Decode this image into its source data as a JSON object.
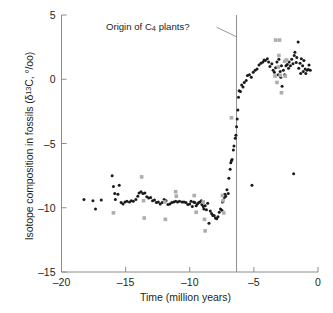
{
  "figure": {
    "annotation": {
      "prefix": "Origin of C",
      "sub": "4",
      "suffix": " plants?"
    },
    "y_axis_label": {
      "prefix": "Isotope composition in fossils (δ",
      "sup": "13",
      "suffix": "C, °/oo)"
    },
    "x_axis_label": "Time (million years)"
  },
  "chart_data": {
    "type": "scatter",
    "title": "",
    "xlabel": "Time (million years)",
    "ylabel": "Isotope composition in fossils (δ13C, °/oo)",
    "xlim": [
      -20,
      0
    ],
    "ylim": [
      -15,
      5
    ],
    "xticks": [
      -20,
      -15,
      -10,
      -5,
      0
    ],
    "xticklabels": [
      "–20",
      "–15",
      "–10",
      "–5",
      "0"
    ],
    "yticks": [
      -15,
      -10,
      -5,
      0,
      5
    ],
    "yticklabels": [
      "–15",
      "–10",
      "–5",
      "0",
      "5"
    ],
    "grid": false,
    "legend": false,
    "annotations": [
      {
        "text": "Origin of C4 plants?",
        "x": -6.35,
        "kind": "vertical-line-with-leader",
        "line_color": "#8c8c8c",
        "leader_from": [
          -7.9,
          4.05
        ],
        "leader_to": [
          -6.35,
          3.3
        ]
      }
    ],
    "series": [
      {
        "name": "black-circles",
        "marker": "circle",
        "color": "#1a1a1a",
        "size": 3.0,
        "points": [
          [
            -18.25,
            -9.35
          ],
          [
            -17.55,
            -9.45
          ],
          [
            -17.35,
            -10.1
          ],
          [
            -16.9,
            -9.4
          ],
          [
            -16.05,
            -7.5
          ],
          [
            -15.95,
            -8.35
          ],
          [
            -15.85,
            -8.9
          ],
          [
            -15.8,
            -9.35
          ],
          [
            -15.6,
            -8.95
          ],
          [
            -15.5,
            -8.25
          ],
          [
            -15.35,
            -9.6
          ],
          [
            -15.2,
            -9.7
          ],
          [
            -15.05,
            -9.55
          ],
          [
            -14.9,
            -9.5
          ],
          [
            -14.7,
            -9.55
          ],
          [
            -14.55,
            -9.45
          ],
          [
            -14.4,
            -9.5
          ],
          [
            -14.2,
            -9.35
          ],
          [
            -14.05,
            -9.1
          ],
          [
            -13.95,
            -8.85
          ],
          [
            -13.8,
            -8.75
          ],
          [
            -13.65,
            -8.9
          ],
          [
            -13.5,
            -8.85
          ],
          [
            -13.35,
            -9.15
          ],
          [
            -13.2,
            -9.25
          ],
          [
            -13.05,
            -9.2
          ],
          [
            -12.9,
            -9.45
          ],
          [
            -12.75,
            -9.4
          ],
          [
            -12.6,
            -9.6
          ],
          [
            -12.45,
            -9.55
          ],
          [
            -12.3,
            -9.7
          ],
          [
            -12.15,
            -9.6
          ],
          [
            -12.0,
            -9.35
          ],
          [
            -11.85,
            -9.45
          ],
          [
            -11.7,
            -9.75
          ],
          [
            -11.55,
            -9.7
          ],
          [
            -11.4,
            -9.6
          ],
          [
            -11.25,
            -9.55
          ],
          [
            -11.1,
            -9.5
          ],
          [
            -10.95,
            -9.55
          ],
          [
            -10.8,
            -9.5
          ],
          [
            -10.6,
            -9.55
          ],
          [
            -10.45,
            -9.55
          ],
          [
            -10.3,
            -9.6
          ],
          [
            -10.15,
            -9.75
          ],
          [
            -10.0,
            -9.7
          ],
          [
            -9.9,
            -9.5
          ],
          [
            -9.8,
            -9.9
          ],
          [
            -9.7,
            -9.55
          ],
          [
            -9.6,
            -9.6
          ],
          [
            -9.5,
            -9.85
          ],
          [
            -9.4,
            -9.7
          ],
          [
            -9.3,
            -9.6
          ],
          [
            -9.2,
            -9.55
          ],
          [
            -9.1,
            -9.45
          ],
          [
            -9.05,
            -9.75
          ],
          [
            -8.95,
            -9.9
          ],
          [
            -8.9,
            -10.1
          ],
          [
            -8.8,
            -9.85
          ],
          [
            -8.7,
            -10.15
          ],
          [
            -8.6,
            -9.65
          ],
          [
            -8.5,
            -11.2
          ],
          [
            -8.4,
            -10.25
          ],
          [
            -8.3,
            -10.45
          ],
          [
            -8.2,
            -10.6
          ],
          [
            -8.1,
            -10.6
          ],
          [
            -8.0,
            -10.8
          ],
          [
            -7.9,
            -10.85
          ],
          [
            -7.8,
            -10.7
          ],
          [
            -7.7,
            -10.35
          ],
          [
            -7.6,
            -10.1
          ],
          [
            -7.5,
            -10.2
          ],
          [
            -7.45,
            -9.55
          ],
          [
            -7.35,
            -9.0
          ],
          [
            -7.3,
            -9.2
          ],
          [
            -7.25,
            -8.95
          ],
          [
            -7.2,
            -9.1
          ],
          [
            -7.1,
            -8.6
          ],
          [
            -7.0,
            -8.9
          ],
          [
            -6.95,
            -7.7
          ],
          [
            -6.85,
            -7.0
          ],
          [
            -6.8,
            -6.5
          ],
          [
            -6.75,
            -6.35
          ],
          [
            -6.7,
            -6.25
          ],
          [
            -6.6,
            -5.5
          ],
          [
            -6.55,
            -5.2
          ],
          [
            -6.45,
            -4.6
          ],
          [
            -6.4,
            -4.35
          ],
          [
            -6.35,
            -3.7
          ],
          [
            -6.3,
            -3.1
          ],
          [
            -6.25,
            -2.4
          ],
          [
            -6.2,
            -1.4
          ],
          [
            -6.15,
            -0.9
          ],
          [
            -6.05,
            -0.95
          ],
          [
            -5.95,
            -0.45
          ],
          [
            -5.85,
            -0.6
          ],
          [
            -5.75,
            -0.25
          ],
          [
            -5.6,
            -0.1
          ],
          [
            -5.5,
            0.3
          ],
          [
            -5.35,
            0.35
          ],
          [
            -5.2,
            0.15
          ],
          [
            -5.05,
            0.55
          ],
          [
            -4.9,
            0.7
          ],
          [
            -4.75,
            0.8
          ],
          [
            -4.6,
            1.1
          ],
          [
            -4.45,
            1.25
          ],
          [
            -4.3,
            1.35
          ],
          [
            -4.2,
            1.5
          ],
          [
            -4.1,
            1.45
          ],
          [
            -3.95,
            1.6
          ],
          [
            -3.85,
            1.35
          ],
          [
            -3.75,
            1.0
          ],
          [
            -3.6,
            1.2
          ],
          [
            -3.5,
            0.7
          ],
          [
            -3.4,
            0.55
          ],
          [
            -3.3,
            0.9
          ],
          [
            -3.2,
            1.35
          ],
          [
            -3.1,
            0.35
          ],
          [
            -3.05,
            1.55
          ],
          [
            -2.95,
            0.6
          ],
          [
            -2.9,
            0.15
          ],
          [
            -2.85,
            1.05
          ],
          [
            -2.8,
            -0.55
          ],
          [
            -2.7,
            0.7
          ],
          [
            -2.6,
            0.35
          ],
          [
            -2.5,
            1.05
          ],
          [
            -2.4,
            1.15
          ],
          [
            -2.3,
            0.85
          ],
          [
            -2.25,
            1.35
          ],
          [
            -2.15,
            1.05
          ],
          [
            -2.05,
            1.55
          ],
          [
            -1.95,
            1.2
          ],
          [
            -1.85,
            1.85
          ],
          [
            -1.8,
            2.1
          ],
          [
            -1.7,
            1.3
          ],
          [
            -1.65,
            1.7
          ],
          [
            -1.55,
            2.9
          ],
          [
            -1.5,
            0.85
          ],
          [
            -1.4,
            1.25
          ],
          [
            -1.35,
            0.45
          ],
          [
            -1.3,
            1.6
          ],
          [
            -1.2,
            1.05
          ],
          [
            -1.15,
            0.6
          ],
          [
            -1.1,
            1.45
          ],
          [
            -1.0,
            0.8
          ],
          [
            -0.95,
            0.45
          ],
          [
            -0.85,
            0.7
          ],
          [
            -0.75,
            0.75
          ],
          [
            -0.7,
            1.1
          ],
          [
            -0.6,
            0.7
          ],
          [
            -5.15,
            -8.25
          ],
          [
            -1.9,
            -7.35
          ]
        ]
      },
      {
        "name": "gray-squares",
        "marker": "square",
        "color": "#adadad",
        "size": 3.6,
        "points": [
          [
            -15.95,
            -10.4
          ],
          [
            -13.75,
            -7.6
          ],
          [
            -13.6,
            -9.45
          ],
          [
            -13.55,
            -10.8
          ],
          [
            -11.95,
            -9.55
          ],
          [
            -11.9,
            -10.9
          ],
          [
            -11.1,
            -8.75
          ],
          [
            -11.05,
            -9.1
          ],
          [
            -9.65,
            -9.05
          ],
          [
            -9.5,
            -10.35
          ],
          [
            -8.95,
            -9.55
          ],
          [
            -8.85,
            -10.9
          ],
          [
            -8.8,
            -11.8
          ],
          [
            -7.45,
            -9.05
          ],
          [
            -7.4,
            -9.45
          ],
          [
            -7.35,
            -10.4
          ],
          [
            -6.75,
            -3.0
          ],
          [
            -3.3,
            3.05
          ],
          [
            -3.0,
            3.05
          ],
          [
            -3.05,
            1.85
          ],
          [
            -3.1,
            0.95
          ],
          [
            -2.95,
            0.3
          ],
          [
            -2.6,
            1.4
          ],
          [
            -2.45,
            1.5
          ],
          [
            -2.55,
            0.25
          ],
          [
            -3.35,
            0.25
          ],
          [
            -3.2,
            -0.25
          ],
          [
            -2.85,
            -1.05
          ]
        ]
      }
    ]
  }
}
